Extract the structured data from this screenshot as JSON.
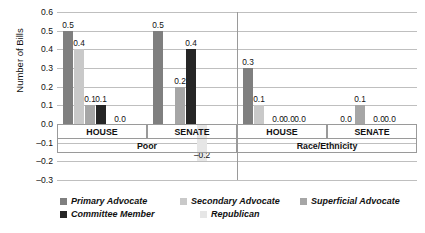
{
  "chart_data": {
    "type": "bar",
    "title": "",
    "xlabel": "",
    "ylabel": "Number of Bills",
    "ylim": [
      -0.3,
      0.6
    ],
    "ytick_step": 0.1,
    "yticks": [
      "0.6",
      "0.5",
      "0.4",
      "0.3",
      "0.2",
      "0.1",
      "0.0",
      "-0.1",
      "-0.2",
      "-0.3"
    ],
    "grid": true,
    "legend_position": "bottom",
    "group_labels_top": [
      "HOUSE",
      "SENATE",
      "HOUSE",
      "SENATE"
    ],
    "group_labels_bottom": [
      "Poor",
      "Race/Ethnicity"
    ],
    "categories": [
      "Poor - HOUSE",
      "Poor - SENATE",
      "Race/Ethnicity - HOUSE",
      "Race/Ethnicity - SENATE"
    ],
    "series": [
      {
        "name": "Primary Advocate",
        "color": "#7f7f7f",
        "values": [
          0.5,
          0.5,
          0.3,
          0.0
        ],
        "labels": [
          "0.5",
          "0.5",
          "0.3",
          "0.0"
        ]
      },
      {
        "name": "Secondary Advocate",
        "color": "#c9c9c9",
        "values": [
          0.4,
          0.0,
          0.1,
          0.0
        ],
        "labels": [
          "0.4",
          "",
          "0.1",
          ""
        ]
      },
      {
        "name": "Superficial Advocate",
        "color": "#a6a6a6",
        "values": [
          0.1,
          0.2,
          0.0,
          0.1
        ],
        "labels": [
          "0.1",
          "0.2",
          "0.0",
          "0.1"
        ]
      },
      {
        "name": "Committee Member",
        "color": "#262626",
        "values": [
          0.1,
          0.4,
          0.0,
          0.0
        ],
        "labels": [
          "0.1",
          "0.4",
          "0.0",
          "0.0"
        ]
      },
      {
        "name": "Republican",
        "color": "#e6e6e6",
        "values": [
          0.0,
          -0.2,
          0.0,
          0.0
        ],
        "labels": [
          "0.0",
          "-0.2",
          "0.0",
          "0.0"
        ]
      }
    ]
  },
  "legend": {
    "row1": [
      {
        "label": "Primary Advocate",
        "color": "#7f7f7f"
      },
      {
        "label": "Secondary Advocate",
        "color": "#c9c9c9"
      },
      {
        "label": "Superficial Advocate",
        "color": "#a6a6a6"
      }
    ],
    "row2": [
      {
        "label": "Committee Member",
        "color": "#262626"
      },
      {
        "label": "Republican",
        "color": "#e6e6e6"
      }
    ]
  }
}
